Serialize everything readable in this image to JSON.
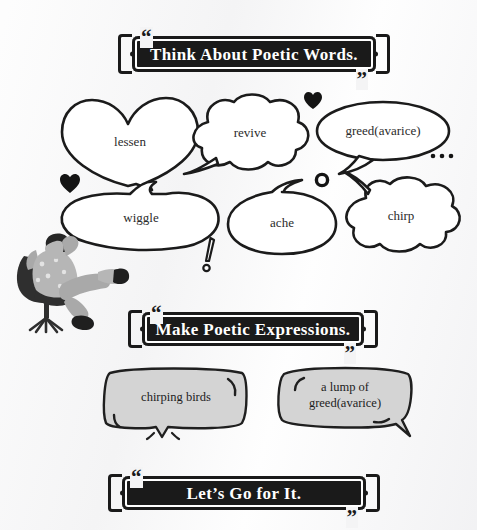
{
  "worksheet": {
    "background_color": "#f4f4f5",
    "banners": [
      {
        "id": "banner-think",
        "text": "Think About Poetic Words.",
        "quote_open": "“",
        "quote_close": "”"
      },
      {
        "id": "banner-make",
        "text": "Make Poetic Expressions.",
        "quote_open": "“",
        "quote_close": "”"
      },
      {
        "id": "banner-lets-go",
        "text": "Let’s Go for It.",
        "quote_open": "“",
        "quote_close": "”"
      }
    ],
    "word_bubbles": [
      {
        "id": "bubble-lessen",
        "word": "lessen",
        "shape": "heart"
      },
      {
        "id": "bubble-revive",
        "word": "revive",
        "shape": "cloud"
      },
      {
        "id": "bubble-greed",
        "word": "greed(avarice)",
        "shape": "oval"
      },
      {
        "id": "bubble-wiggle",
        "word": "wiggle",
        "shape": "blob"
      },
      {
        "id": "bubble-ache",
        "word": "ache",
        "shape": "oval"
      },
      {
        "id": "bubble-chirp",
        "word": "chirp",
        "shape": "cloud"
      }
    ],
    "phrase_bubbles": [
      {
        "id": "phrase-chirping-birds",
        "line1": "chirping birds",
        "line2": "",
        "fill": "#d4d4d4"
      },
      {
        "id": "phrase-lump-of-greed",
        "line1": "a lump of",
        "line2": "greed(avarice)",
        "fill": "#d4d4d4"
      }
    ],
    "decorations": [
      {
        "id": "heart-small-top",
        "glyph": "heart"
      },
      {
        "id": "heart-small-left",
        "glyph": "heart"
      },
      {
        "id": "ring-dot",
        "glyph": "ring"
      },
      {
        "id": "ellipsis-dots",
        "glyph": "dots"
      },
      {
        "id": "exclamation-mark",
        "glyph": "exclamation"
      }
    ],
    "illustration": {
      "id": "person-reclining-in-chair",
      "description": "person leaning back in an office chair with legs stretched out",
      "skin_color": "#b9b9b9",
      "hair_color": "#2b2b2b",
      "chair_color": "#3a3a3a"
    }
  }
}
